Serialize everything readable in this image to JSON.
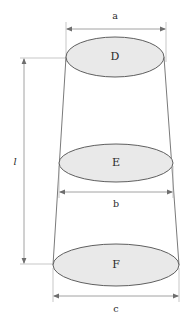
{
  "figure": {
    "background_color": "#ffffff",
    "shape_fill_color": "#e9e9e9",
    "shape_stroke_color": "#5f5f5f",
    "dimension_line_color": "#8a8a8a",
    "edge_color": "#6b6b6b"
  },
  "cross_sections": [
    {
      "label": "D",
      "position": "top",
      "center_x": 115,
      "center_y": 57,
      "radius_x": 49,
      "radius_y": 20
    },
    {
      "label": "E",
      "position": "middle",
      "center_x": 116,
      "center_y": 163,
      "radius_x": 57,
      "radius_y": 19
    },
    {
      "label": "F",
      "position": "bottom",
      "center_x": 116,
      "center_y": 265,
      "radius_x": 63,
      "radius_y": 21
    }
  ],
  "dimensions": [
    {
      "label": "a",
      "orientation": "horizontal",
      "placement": "above-top-section",
      "label_x": 115,
      "label_y": 16,
      "line_y": 29,
      "x_start": 66,
      "x_end": 166
    },
    {
      "label": "b",
      "orientation": "horizontal",
      "placement": "below-middle-section",
      "label_x": 116,
      "label_y": 204,
      "line_y": 192,
      "x_start": 59,
      "x_end": 173
    },
    {
      "label": "c",
      "orientation": "horizontal",
      "placement": "below-bottom-section",
      "label_x": 116,
      "label_y": 309,
      "line_y": 296,
      "x_start": 53,
      "x_end": 179
    },
    {
      "label": "l",
      "orientation": "vertical",
      "placement": "left-of-figure",
      "style": "italic",
      "label_x": 15,
      "label_y": 162,
      "line_x": 24,
      "y_start": 58,
      "y_end": 264
    }
  ]
}
